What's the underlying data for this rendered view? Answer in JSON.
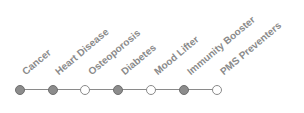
{
  "timeline": {
    "items": [
      {
        "label": "Cancer",
        "filled": true
      },
      {
        "label": "Heart Disease",
        "filled": true
      },
      {
        "label": "Osteoporosis",
        "filled": false
      },
      {
        "label": "Diabetes",
        "filled": true
      },
      {
        "label": "Mood Lifter",
        "filled": false
      },
      {
        "label": "Immunity Booster",
        "filled": true
      },
      {
        "label": "PMS Preventers",
        "filled": false
      }
    ],
    "colors": {
      "filled": "#8c8c8c",
      "empty": "#ffffff",
      "line": "#8a8a8a",
      "text": "#8a8a8a"
    }
  }
}
